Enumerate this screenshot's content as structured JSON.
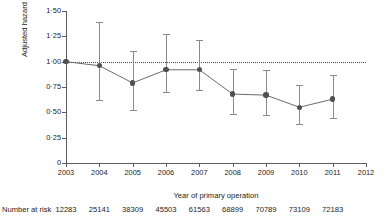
{
  "chart_data": {
    "type": "line",
    "title": "",
    "xlabel": "Year of primary operation",
    "ylabel": "Adjusted hazard ratio (%)",
    "xlim": [
      2003,
      2012
    ],
    "ylim": [
      0,
      1.5
    ],
    "grid": false,
    "legend": "none",
    "reference_line": {
      "y": 1.0,
      "style": "dotted"
    },
    "x": [
      2003,
      2004,
      2005,
      2006,
      2007,
      2008,
      2009,
      2010,
      2011
    ],
    "values": [
      1.0,
      0.96,
      0.79,
      0.92,
      0.92,
      0.68,
      0.67,
      0.55,
      0.63
    ],
    "ci_lower": [
      1.0,
      0.62,
      0.52,
      0.7,
      0.72,
      0.48,
      0.47,
      0.38,
      0.44
    ],
    "ci_upper": [
      1.0,
      1.39,
      1.11,
      1.27,
      1.21,
      0.93,
      0.92,
      0.77,
      0.87
    ],
    "ytick_labels": [
      "1·50",
      "1·25",
      "1·00",
      "0·75",
      "0·50",
      "0·25",
      "0"
    ],
    "ytick_values": [
      1.5,
      1.25,
      1.0,
      0.75,
      0.5,
      0.25,
      0
    ],
    "xtick_labels": [
      "2003",
      "2004",
      "2005",
      "2006",
      "2007",
      "2008",
      "2009",
      "2010",
      "2011",
      "2012"
    ],
    "xtick_values": [
      2003,
      2004,
      2005,
      2006,
      2007,
      2008,
      2009,
      2010,
      2011,
      2012
    ],
    "marker_color": "#4f4f4f",
    "line_color": "#6b6b6b",
    "errorbar_color": "#8a8a8a",
    "axis_color": "#5c5c5c"
  },
  "risk_table": {
    "label": "Number at risk",
    "years": [
      2003,
      2004,
      2005,
      2006,
      2007,
      2008,
      2009,
      2010,
      2011
    ],
    "counts": [
      "12283",
      "25141",
      "38309",
      "45503",
      "61563",
      "68899",
      "70789",
      "73109",
      "72183"
    ]
  }
}
